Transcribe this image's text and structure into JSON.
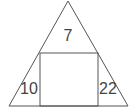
{
  "diagram": {
    "type": "triangle-with-inscribed-rectangle",
    "stroke_color": "#555555",
    "background": "#ffffff",
    "regions": [
      {
        "id": "top-triangle",
        "label": "7"
      },
      {
        "id": "left-triangle",
        "label": "10"
      },
      {
        "id": "right-triangle",
        "label": "22"
      },
      {
        "id": "rectangle",
        "label": ""
      }
    ]
  }
}
